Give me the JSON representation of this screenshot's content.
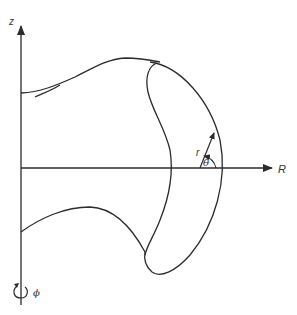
{
  "diagram": {
    "colors": {
      "stroke": "#2b2b2b",
      "background": "#ffffff"
    },
    "axes": {
      "vertical": {
        "label": "z"
      },
      "horizontal": {
        "label": "R"
      }
    },
    "local_coordinates": {
      "radial": {
        "label": "r"
      },
      "angle": {
        "label": "θ"
      }
    },
    "rotation": {
      "label": "ϕ"
    }
  }
}
